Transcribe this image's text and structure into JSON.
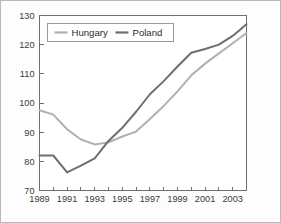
{
  "figure": {
    "border_color": "#b9b9b9",
    "background": "#fdfdfd"
  },
  "legend": {
    "position": "top-left-inside",
    "entries": [
      {
        "label": "Hungary",
        "color": "#b0b0b0"
      },
      {
        "label": "Poland",
        "color": "#6e6e6e"
      }
    ]
  },
  "chart_data": {
    "type": "line",
    "title": "",
    "subtitle": "",
    "xlabel": "",
    "ylabel": "",
    "xlim": [
      1989,
      2004
    ],
    "ylim": [
      70,
      130
    ],
    "grid": false,
    "legend_position": "top-left-inside",
    "x": [
      1989,
      1990,
      1991,
      1992,
      1993,
      1994,
      1995,
      1996,
      1997,
      1998,
      1999,
      2000,
      2001,
      2002,
      2003,
      2004
    ],
    "xticks": [
      1989,
      1990,
      1991,
      1992,
      1993,
      1994,
      1995,
      1996,
      1997,
      1998,
      1999,
      2000,
      2001,
      2002,
      2003,
      2004
    ],
    "xtick_labels": [
      "1989",
      "",
      "1991",
      "",
      "1993",
      "",
      "1995",
      "",
      "1997",
      "",
      "1999",
      "",
      "2001",
      "",
      "2003",
      ""
    ],
    "xtick_labels_shown": [
      "1989",
      "1991",
      "1993",
      "1995",
      "1997",
      "1999",
      "2001",
      "2003"
    ],
    "yticks": [
      70,
      80,
      90,
      100,
      110,
      120,
      130
    ],
    "ytick_labels": [
      "70",
      "80",
      "90",
      "100",
      "110",
      "120",
      "130"
    ],
    "series": [
      {
        "name": "Hungary",
        "color": "#b0b0b0",
        "values": [
          97.5,
          96.0,
          91.0,
          87.5,
          85.8,
          86.5,
          88.5,
          90.2,
          94.5,
          99.0,
          104.0,
          109.5,
          113.5,
          117.0,
          120.5,
          124.0
        ]
      },
      {
        "name": "Poland",
        "color": "#6e6e6e",
        "values": [
          82.0,
          82.0,
          76.2,
          78.5,
          81.0,
          87.0,
          91.5,
          97.0,
          103.0,
          107.5,
          112.5,
          117.2,
          118.5,
          120.0,
          123.0,
          127.0
        ]
      }
    ]
  }
}
